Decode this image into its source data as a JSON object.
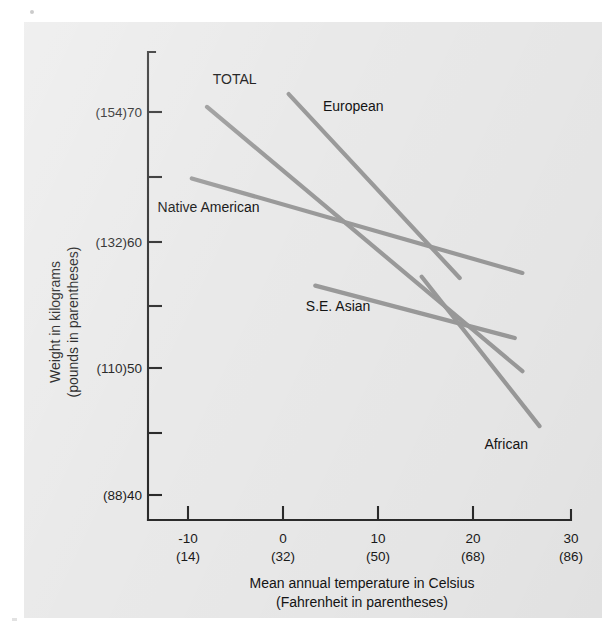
{
  "figure": {
    "background_color": "#e9e9e9",
    "page_color": "#ffffff",
    "line_color": "#9a9a9a",
    "axis_color": "#2b2b2b"
  },
  "chart_data": {
    "type": "line",
    "title": "",
    "xlabel": "Mean annual temperature in Celsius",
    "xlabel_sub": "(Fahrenheit in parentheses)",
    "ylabel": "Weight in kilograms",
    "ylabel_sub": "(pounds in parentheses)",
    "xlim": [
      -15,
      30
    ],
    "ylim": [
      38,
      73
    ],
    "grid": false,
    "legend": "inline-labels",
    "x_ticks": [
      {
        "value": -10,
        "label": "-10",
        "sublabel": "(14)"
      },
      {
        "value": 0,
        "label": "0",
        "sublabel": "(32)"
      },
      {
        "value": 10,
        "label": "10",
        "sublabel": "(50)"
      },
      {
        "value": 20,
        "label": "20",
        "sublabel": "(68)"
      },
      {
        "value": 30,
        "label": "30",
        "sublabel": "(86)"
      }
    ],
    "y_ticks": [
      {
        "value": 70,
        "label": "(154)70",
        "major": true
      },
      {
        "value": 65,
        "label": "",
        "major": false
      },
      {
        "value": 60,
        "label": "(132)60",
        "major": true
      },
      {
        "value": 55,
        "label": "",
        "major": false
      },
      {
        "value": 50,
        "label": "(110)50",
        "major": true
      },
      {
        "value": 45,
        "label": "",
        "major": false
      },
      {
        "value": 40,
        "label": "(88)40",
        "major": true
      }
    ],
    "series": [
      {
        "name": "TOTAL",
        "label": "TOTAL",
        "points": [
          {
            "x": -8.0,
            "y": 70.4
          },
          {
            "x": 25.2,
            "y": 49.7
          }
        ],
        "label_pos": {
          "x": -7.4,
          "y": 72.2
        }
      },
      {
        "name": "European",
        "label": "European",
        "points": [
          {
            "x": 0.6,
            "y": 71.4
          },
          {
            "x": 18.6,
            "y": 57.0
          }
        ],
        "label_pos": {
          "x": 4.2,
          "y": 70.1
        }
      },
      {
        "name": "Native American",
        "label": "Native American",
        "points": [
          {
            "x": -9.6,
            "y": 64.8
          },
          {
            "x": 25.2,
            "y": 57.4
          }
        ],
        "label_pos": {
          "x": -13.2,
          "y": 62.2
        }
      },
      {
        "name": "S.E. Asian",
        "label": "S.E. Asian",
        "points": [
          {
            "x": 3.4,
            "y": 56.4
          },
          {
            "x": 24.4,
            "y": 52.3
          }
        ],
        "label_pos": {
          "x": 2.4,
          "y": 54.4
        }
      },
      {
        "name": "African",
        "label": "African",
        "points": [
          {
            "x": 14.6,
            "y": 57.1
          },
          {
            "x": 27.0,
            "y": 45.4
          }
        ],
        "label_pos": {
          "x": 21.2,
          "y": 43.6
        }
      }
    ]
  }
}
